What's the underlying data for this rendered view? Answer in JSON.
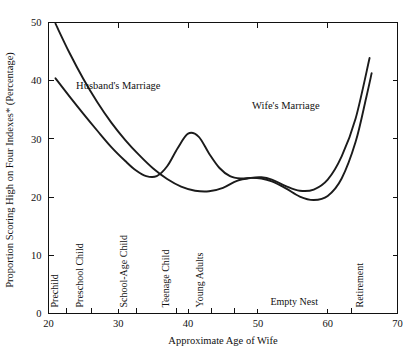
{
  "chart_data": {
    "type": "line",
    "title": "",
    "xlabel": "Approximate Age of Wife",
    "ylabel": "Proportion Scoring High on Four Indexes* (Percentage)",
    "xlim": [
      20,
      70
    ],
    "ylim": [
      0,
      50
    ],
    "xticks": [
      20,
      30,
      40,
      50,
      60,
      70
    ],
    "yticks": [
      0,
      10,
      20,
      30,
      40,
      50
    ],
    "grid": false,
    "legend_position": "inline-annotations",
    "series": [
      {
        "name": "Husband's Marriage",
        "points": [
          [
            21.0,
            49.8
          ],
          [
            23.0,
            44.8
          ],
          [
            25.0,
            40.3
          ],
          [
            27.0,
            36.3
          ],
          [
            29.0,
            32.8
          ],
          [
            31.0,
            29.8
          ],
          [
            33.0,
            27.2
          ],
          [
            35.0,
            24.9
          ],
          [
            37.0,
            23.1
          ],
          [
            39.0,
            21.8
          ],
          [
            41.0,
            21.1
          ],
          [
            43.0,
            21.0
          ],
          [
            45.0,
            21.6
          ],
          [
            47.0,
            22.8
          ],
          [
            49.0,
            23.3
          ],
          [
            50.5,
            23.4
          ],
          [
            52.0,
            23.0
          ],
          [
            54.0,
            21.9
          ],
          [
            56.0,
            21.1
          ],
          [
            58.0,
            21.3
          ],
          [
            60.0,
            23.0
          ],
          [
            62.0,
            27.0
          ],
          [
            64.0,
            33.5
          ],
          [
            66.0,
            43.9
          ]
        ]
      },
      {
        "name": "Wife's Marriage",
        "points": [
          [
            21.0,
            40.4
          ],
          [
            23.0,
            37.3
          ],
          [
            25.0,
            34.3
          ],
          [
            27.0,
            31.4
          ],
          [
            29.0,
            28.6
          ],
          [
            31.0,
            26.2
          ],
          [
            32.5,
            24.6
          ],
          [
            34.0,
            23.6
          ],
          [
            35.5,
            23.6
          ],
          [
            37.0,
            25.3
          ],
          [
            38.5,
            28.4
          ],
          [
            40.0,
            30.9
          ],
          [
            41.5,
            30.4
          ],
          [
            43.0,
            27.5
          ],
          [
            44.5,
            25.0
          ],
          [
            46.0,
            23.6
          ],
          [
            47.5,
            23.2
          ],
          [
            49.0,
            23.3
          ],
          [
            50.5,
            23.2
          ],
          [
            52.0,
            22.7
          ],
          [
            54.0,
            21.5
          ],
          [
            56.0,
            20.1
          ],
          [
            58.0,
            19.5
          ],
          [
            60.0,
            20.2
          ],
          [
            62.0,
            23.2
          ],
          [
            64.0,
            29.5
          ],
          [
            65.5,
            37.0
          ],
          [
            66.3,
            41.3
          ]
        ]
      }
    ],
    "series_annotations": [
      {
        "text": "Husband's Marriage",
        "x": 30.0,
        "y": 38.5
      },
      {
        "text": "Wife's Marriage",
        "x": 54.0,
        "y": 35.2
      }
    ],
    "stage_boundaries": [
      22.6,
      26.1,
      32.6,
      38.4,
      43.4,
      46.7,
      63.4
    ],
    "stage_labels": [
      {
        "text": "Prechild",
        "x": 21.4,
        "orientation": "vertical"
      },
      {
        "text": "Preschool Child",
        "x": 24.9,
        "orientation": "vertical"
      },
      {
        "text": "School-Age Child",
        "x": 31.3,
        "orientation": "vertical"
      },
      {
        "text": "Teenage Child",
        "x": 37.2,
        "orientation": "vertical"
      },
      {
        "text": "Young Adults",
        "x": 42.2,
        "orientation": "vertical"
      },
      {
        "text": "Empty Nest",
        "x": 55.2,
        "orientation": "horizontal"
      },
      {
        "text": "Retirement",
        "x": 65.1,
        "orientation": "vertical"
      }
    ]
  }
}
